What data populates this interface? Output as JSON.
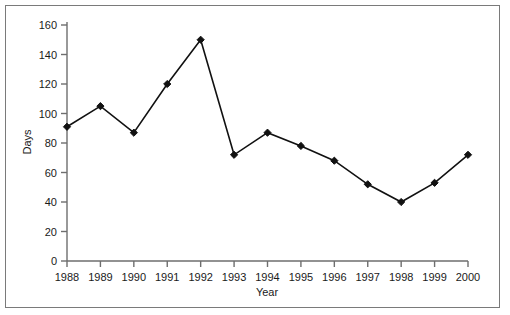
{
  "chart_data": {
    "type": "line",
    "title": "",
    "xlabel": "Year",
    "ylabel": "Days",
    "categories": [
      "1988",
      "1989",
      "1990",
      "1991",
      "1992",
      "1993",
      "1994",
      "1995",
      "1996",
      "1997",
      "1998",
      "1999",
      "2000"
    ],
    "values": [
      91,
      105,
      87,
      120,
      150,
      72,
      87,
      78,
      68,
      52,
      40,
      53,
      72
    ],
    "x": [
      1988,
      1989,
      1990,
      1991,
      1992,
      1993,
      1994,
      1995,
      1996,
      1997,
      1998,
      1999,
      2000
    ],
    "xlim": [
      1988,
      2000
    ],
    "ylim": [
      0,
      160
    ],
    "y_ticks": [
      0,
      20,
      40,
      60,
      80,
      100,
      120,
      140,
      160
    ],
    "y_tick_labels": [
      "0",
      "20",
      "40",
      "60",
      "80",
      "100",
      "120",
      "140",
      "160"
    ],
    "x_ticks": [
      1988,
      1989,
      1990,
      1991,
      1992,
      1993,
      1994,
      1995,
      1996,
      1997,
      1998,
      1999,
      2000
    ],
    "x_tick_labels": [
      "1988",
      "1989",
      "1990",
      "1991",
      "1992",
      "1993",
      "1994",
      "1995",
      "1996",
      "1997",
      "1998",
      "1999",
      "2000"
    ],
    "grid": false,
    "legend": null,
    "legend_position": "none",
    "series": [
      {
        "name": "Days",
        "values": [
          91,
          105,
          87,
          120,
          150,
          72,
          87,
          78,
          68,
          52,
          40,
          53,
          72
        ],
        "line_color": "#111111",
        "marker": "diamond",
        "marker_color": "#111111"
      }
    ],
    "colors": {
      "line": "#111111",
      "marker": "#111111",
      "axis": "#6e6e6e",
      "text": "#1a1a1a",
      "frame": "#7a7a7a",
      "background": "#ffffff"
    }
  }
}
